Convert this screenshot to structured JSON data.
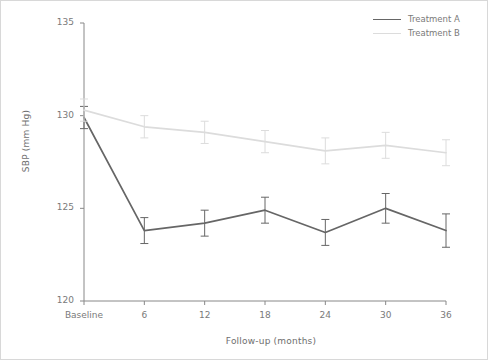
{
  "chart_data": {
    "type": "line",
    "title": "",
    "xlabel": "Follow-up (months)",
    "ylabel": "SBP (mm Hg)",
    "categories": [
      "Baseline",
      "6",
      "12",
      "18",
      "24",
      "30",
      "36"
    ],
    "x": [
      0,
      6,
      12,
      18,
      24,
      30,
      36
    ],
    "xlim": [
      -3,
      39
    ],
    "ylim": [
      120,
      135
    ],
    "yticks": [
      120,
      125,
      130,
      135
    ],
    "ytick_labels": [
      "120",
      "125",
      "130",
      "135"
    ],
    "grid": false,
    "legend_position": "top-right",
    "error_bars": true,
    "series": [
      {
        "name": "Treatment A",
        "color": "#666666",
        "values": [
          129.9,
          123.8,
          124.2,
          124.9,
          123.7,
          125.0,
          123.8
        ],
        "errors": [
          0.6,
          0.7,
          0.7,
          0.7,
          0.7,
          0.8,
          0.9
        ]
      },
      {
        "name": "Treatment B",
        "color": "#dcdcdc",
        "values": [
          130.3,
          129.4,
          129.1,
          128.6,
          128.1,
          128.4,
          128.0
        ],
        "errors": [
          0.6,
          0.6,
          0.6,
          0.6,
          0.7,
          0.7,
          0.7
        ]
      }
    ]
  },
  "axes": {
    "y_title": "SBP (mm Hg)",
    "x_title": "Follow-up (months)",
    "spine_color": "#888888",
    "tick_color": "#7a7a7a"
  },
  "legend": {
    "entries": [
      {
        "label": "Treatment A",
        "color": "#666666"
      },
      {
        "label": "Treatment B",
        "color": "#dcdcdc"
      }
    ]
  }
}
